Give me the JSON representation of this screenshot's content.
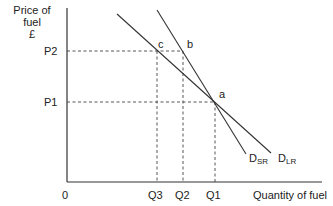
{
  "diagram": {
    "y_axis_label": [
      "Price of",
      "fuel",
      "£"
    ],
    "x_axis_label": "Quantity of fuel",
    "origin_label": "0",
    "price_ticks": [
      {
        "label": "P2"
      },
      {
        "label": "P1"
      }
    ],
    "quantity_ticks": [
      {
        "label": "Q3"
      },
      {
        "label": "Q2"
      },
      {
        "label": "Q1"
      }
    ],
    "points": [
      {
        "label": "a"
      },
      {
        "label": "b"
      },
      {
        "label": "c"
      }
    ],
    "curves": [
      {
        "main": "D",
        "sub": "SR"
      },
      {
        "main": "D",
        "sub": "LR"
      }
    ],
    "colors": {
      "line": "#333333",
      "background": "#ffffff"
    }
  }
}
